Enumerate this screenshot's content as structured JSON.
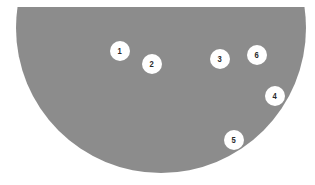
{
  "figure": {
    "shape": "circle-clipped-top",
    "fill_color": "#8c8c8c",
    "background_color": "#ffffff",
    "center": {
      "x": 161,
      "y": 28
    },
    "radius": 145,
    "clip_top_y": 7
  },
  "markers": [
    {
      "label": "1",
      "x": 120,
      "y": 51
    },
    {
      "label": "2",
      "x": 152,
      "y": 64
    },
    {
      "label": "3",
      "x": 220,
      "y": 59
    },
    {
      "label": "4",
      "x": 275,
      "y": 96
    },
    {
      "label": "5",
      "x": 234,
      "y": 140
    },
    {
      "label": "6",
      "x": 257,
      "y": 55
    }
  ],
  "marker_style": {
    "fill": "#ffffff",
    "text_color": "#2a2a2a",
    "diameter": 20
  }
}
